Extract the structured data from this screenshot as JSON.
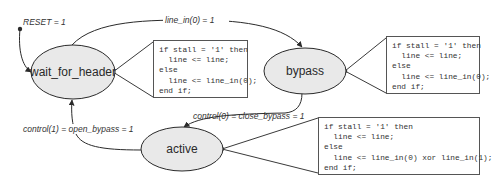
{
  "diagram": {
    "type": "state-machine",
    "colors": {
      "state_fill": "#e9e9e9",
      "stroke": "#3a3a3a",
      "text": "#2a2a2a"
    },
    "states": [
      {
        "id": "wait_for_header",
        "label": "wait_for_header"
      },
      {
        "id": "bypass",
        "label": "bypass"
      },
      {
        "id": "active",
        "label": "active"
      }
    ],
    "transitions": [
      {
        "id": "reset",
        "from": "initial",
        "to": "wait_for_header",
        "label": "RESET = 1"
      },
      {
        "id": "header_to_bypass",
        "from": "wait_for_header",
        "to": "bypass",
        "label": "line_in(0) = 1"
      },
      {
        "id": "bypass_to_active",
        "from": "bypass",
        "to": "active",
        "label": "control(0) = close_bypass = 1"
      },
      {
        "id": "active_to_header",
        "from": "active",
        "to": "wait_for_header",
        "label": "control(1) = open_bypass = 1"
      }
    ],
    "code_notes": [
      {
        "attached_to": "wait_for_header",
        "lines": [
          "if stall = '1' then",
          "  line <= line;",
          "else",
          "  line <= line_in(0);",
          "end if;"
        ]
      },
      {
        "attached_to": "bypass",
        "lines": [
          "if stall = '1' then",
          "  line <= line;",
          "else",
          "  line <= line_in(0);",
          "end if;"
        ]
      },
      {
        "attached_to": "active",
        "lines": [
          "if stall = '1' then",
          "  line <= line;",
          "else",
          "  line <= line_in(0) xor line_in(1);",
          "end if;"
        ]
      }
    ]
  }
}
